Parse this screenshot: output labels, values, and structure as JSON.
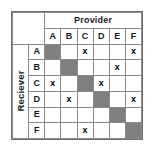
{
  "diagram": {
    "type": "adjacency-matrix",
    "column_axis_label": "Provider",
    "row_axis_label": "Reciever",
    "column_headers": [
      "A",
      "B",
      "C",
      "D",
      "E",
      "F"
    ],
    "row_headers": [
      "A",
      "B",
      "C",
      "D",
      "E",
      "F"
    ],
    "mark_symbol": "x",
    "empty_symbol": "",
    "colors": {
      "diagonal_fill": "#808080",
      "header_fill": "#d9d9d9",
      "cell_fill": "#ffffff",
      "grid_line": "#8a8a8a",
      "outer_border": "#6f6f6f",
      "text": "#1a1a1a"
    },
    "rows": [
      {
        "label": "A",
        "cells": [
          {
            "col": "A",
            "state": "diagonal",
            "text": ""
          },
          {
            "col": "B",
            "state": "empty",
            "text": ""
          },
          {
            "col": "C",
            "state": "marked",
            "text": "x"
          },
          {
            "col": "D",
            "state": "empty",
            "text": ""
          },
          {
            "col": "E",
            "state": "empty",
            "text": ""
          },
          {
            "col": "F",
            "state": "marked",
            "text": "x"
          }
        ]
      },
      {
        "label": "B",
        "cells": [
          {
            "col": "A",
            "state": "empty",
            "text": ""
          },
          {
            "col": "B",
            "state": "diagonal",
            "text": ""
          },
          {
            "col": "C",
            "state": "empty",
            "text": ""
          },
          {
            "col": "D",
            "state": "empty",
            "text": ""
          },
          {
            "col": "E",
            "state": "marked",
            "text": "x"
          },
          {
            "col": "F",
            "state": "empty",
            "text": ""
          }
        ]
      },
      {
        "label": "C",
        "cells": [
          {
            "col": "A",
            "state": "marked",
            "text": "x"
          },
          {
            "col": "B",
            "state": "empty",
            "text": ""
          },
          {
            "col": "C",
            "state": "diagonal",
            "text": ""
          },
          {
            "col": "D",
            "state": "marked",
            "text": "x"
          },
          {
            "col": "E",
            "state": "empty",
            "text": ""
          },
          {
            "col": "F",
            "state": "empty",
            "text": ""
          }
        ]
      },
      {
        "label": "D",
        "cells": [
          {
            "col": "A",
            "state": "empty",
            "text": ""
          },
          {
            "col": "B",
            "state": "marked",
            "text": "x"
          },
          {
            "col": "C",
            "state": "empty",
            "text": ""
          },
          {
            "col": "D",
            "state": "diagonal",
            "text": ""
          },
          {
            "col": "E",
            "state": "empty",
            "text": ""
          },
          {
            "col": "F",
            "state": "marked",
            "text": "x"
          }
        ]
      },
      {
        "label": "E",
        "cells": [
          {
            "col": "A",
            "state": "empty",
            "text": ""
          },
          {
            "col": "B",
            "state": "empty",
            "text": ""
          },
          {
            "col": "C",
            "state": "empty",
            "text": ""
          },
          {
            "col": "D",
            "state": "empty",
            "text": ""
          },
          {
            "col": "E",
            "state": "diagonal",
            "text": ""
          },
          {
            "col": "F",
            "state": "empty",
            "text": ""
          }
        ]
      },
      {
        "label": "F",
        "cells": [
          {
            "col": "A",
            "state": "empty",
            "text": ""
          },
          {
            "col": "B",
            "state": "empty",
            "text": ""
          },
          {
            "col": "C",
            "state": "marked",
            "text": "x"
          },
          {
            "col": "D",
            "state": "empty",
            "text": ""
          },
          {
            "col": "E",
            "state": "empty",
            "text": ""
          },
          {
            "col": "F",
            "state": "diagonal",
            "text": ""
          }
        ]
      }
    ]
  }
}
